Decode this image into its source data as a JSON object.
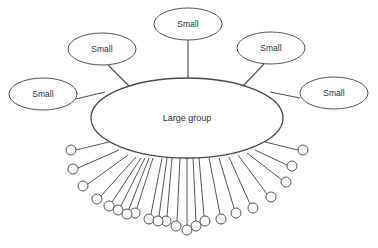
{
  "diagram": {
    "type": "hub-and-spoke-network",
    "canvas": {
      "width": 378,
      "height": 248,
      "background": "#ffffff"
    },
    "colors": {
      "stroke": "#555555",
      "hub_stroke": "#4a4a4a",
      "fill": "#ffffff",
      "text": "#2e2e2e"
    },
    "hub": {
      "label": "Large group",
      "cx": 187,
      "cy": 118,
      "rx": 96,
      "ry": 40
    },
    "small_groups": [
      {
        "id": "small-left",
        "label": "Small",
        "cx": 43,
        "cy": 94,
        "rx": 34,
        "ry": 16,
        "link_x1": 76,
        "link_y1": 99,
        "link_x2": 105,
        "link_y2": 92
      },
      {
        "id": "small-upper-left",
        "label": "Small",
        "cx": 102,
        "cy": 49,
        "rx": 34,
        "ry": 16,
        "link_x1": 108,
        "link_y1": 65,
        "link_x2": 131,
        "link_y2": 88
      },
      {
        "id": "small-top",
        "label": "Small",
        "cx": 188,
        "cy": 24,
        "rx": 34,
        "ry": 16,
        "link_x1": 188,
        "link_y1": 40,
        "link_x2": 188,
        "link_y2": 78
      },
      {
        "id": "small-upper-right",
        "label": "Small",
        "cx": 271,
        "cy": 48,
        "rx": 34,
        "ry": 16,
        "link_x1": 264,
        "link_y1": 64,
        "link_x2": 241,
        "link_y2": 88
      },
      {
        "id": "small-right",
        "label": "Small",
        "cx": 334,
        "cy": 93,
        "rx": 34,
        "ry": 16,
        "link_x1": 300,
        "link_y1": 98,
        "link_x2": 270,
        "link_y2": 92
      }
    ],
    "individual_members": {
      "count": 22,
      "circle_radius": 5,
      "items": [
        {
          "cx": 71,
          "cy": 150,
          "link_x1": 76,
          "link_y1": 150,
          "link_x2": 109,
          "link_y2": 142
        },
        {
          "cx": 73,
          "cy": 169,
          "link_x1": 78,
          "link_y1": 168,
          "link_x2": 119,
          "link_y2": 150
        },
        {
          "cx": 83,
          "cy": 186,
          "link_x1": 88,
          "link_y1": 184,
          "link_x2": 128,
          "link_y2": 155
        },
        {
          "cx": 97,
          "cy": 199,
          "link_x1": 101,
          "link_y1": 196,
          "link_x2": 136,
          "link_y2": 157
        },
        {
          "cx": 118,
          "cy": 210,
          "link_x1": 121,
          "link_y1": 206,
          "link_x2": 145,
          "link_y2": 158
        },
        {
          "cx": 135,
          "cy": 213,
          "link_x1": 137,
          "link_y1": 208,
          "link_x2": 153,
          "link_y2": 158
        },
        {
          "cx": 149,
          "cy": 219,
          "link_x1": 151,
          "link_y1": 214,
          "link_x2": 162,
          "link_y2": 158
        },
        {
          "cx": 166,
          "cy": 221,
          "link_x1": 167,
          "link_y1": 216,
          "link_x2": 172,
          "link_y2": 158
        },
        {
          "cx": 187,
          "cy": 230,
          "link_x1": 187,
          "link_y1": 225,
          "link_x2": 187,
          "link_y2": 158
        },
        {
          "cx": 205,
          "cy": 221,
          "link_x1": 204,
          "link_y1": 216,
          "link_x2": 199,
          "link_y2": 158
        },
        {
          "cx": 221,
          "cy": 219,
          "link_x1": 220,
          "link_y1": 214,
          "link_x2": 209,
          "link_y2": 158
        },
        {
          "cx": 236,
          "cy": 213,
          "link_x1": 234,
          "link_y1": 208,
          "link_x2": 219,
          "link_y2": 158
        },
        {
          "cx": 253,
          "cy": 208,
          "link_x1": 250,
          "link_y1": 204,
          "link_x2": 229,
          "link_y2": 157
        },
        {
          "cx": 271,
          "cy": 197,
          "link_x1": 267,
          "link_y1": 194,
          "link_x2": 238,
          "link_y2": 155
        },
        {
          "cx": 286,
          "cy": 182,
          "link_x1": 282,
          "link_y1": 180,
          "link_x2": 247,
          "link_y2": 153
        },
        {
          "cx": 292,
          "cy": 166,
          "link_x1": 287,
          "link_y1": 165,
          "link_x2": 255,
          "link_y2": 150
        },
        {
          "cx": 303,
          "cy": 150,
          "link_x1": 298,
          "link_y1": 150,
          "link_x2": 265,
          "link_y2": 142
        },
        {
          "cx": 109,
          "cy": 206,
          "link_x1": 112,
          "link_y1": 202,
          "link_x2": 141,
          "link_y2": 158
        },
        {
          "cx": 127,
          "cy": 214,
          "link_x1": 129,
          "link_y1": 209,
          "link_x2": 149,
          "link_y2": 158
        },
        {
          "cx": 158,
          "cy": 221,
          "link_x1": 159,
          "link_y1": 216,
          "link_x2": 167,
          "link_y2": 158
        },
        {
          "cx": 176,
          "cy": 226,
          "link_x1": 177,
          "link_y1": 221,
          "link_x2": 180,
          "link_y2": 158
        },
        {
          "cx": 196,
          "cy": 226,
          "link_x1": 196,
          "link_y1": 221,
          "link_x2": 193,
          "link_y2": 158
        }
      ]
    }
  }
}
